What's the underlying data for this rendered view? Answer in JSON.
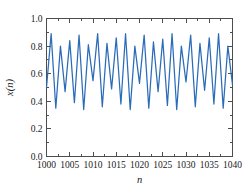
{
  "chart_data": {
    "type": "line",
    "title": "",
    "xlabel": "n",
    "ylabel": "x(n)",
    "xlim": [
      1000,
      1040
    ],
    "ylim": [
      0.0,
      1.0
    ],
    "grid": false,
    "legend": null,
    "line_color": "#2b6cb8",
    "xticks": [
      1000,
      1005,
      1010,
      1015,
      1020,
      1025,
      1030,
      1035,
      1040
    ],
    "xticklabels": [
      "1000",
      "1005",
      "1010",
      "1015",
      "1020",
      "1025",
      "1030",
      "1035",
      "1040"
    ],
    "yticks": [
      0.0,
      0.2,
      0.4,
      0.6,
      0.8,
      1.0
    ],
    "yticklabels": [
      "0.0",
      "0.2",
      "0.4",
      "0.6",
      "0.8",
      "1.0"
    ],
    "xminorticks": [
      1002.5,
      1007.5,
      1012.5,
      1017.5,
      1022.5,
      1027.5,
      1032.5,
      1037.5
    ],
    "yminorticks": [
      0.1,
      0.3,
      0.5,
      0.7,
      0.9
    ],
    "x": [
      1000,
      1001,
      1002,
      1003,
      1004,
      1005,
      1006,
      1007,
      1008,
      1009,
      1010,
      1011,
      1012,
      1013,
      1014,
      1015,
      1016,
      1017,
      1018,
      1019,
      1020,
      1021,
      1022,
      1023,
      1024,
      1025,
      1026,
      1027,
      1028,
      1029,
      1030,
      1031,
      1032,
      1033,
      1034,
      1035,
      1036,
      1037,
      1038,
      1039,
      1040
    ],
    "values": [
      0.5,
      0.89,
      0.35,
      0.8,
      0.47,
      0.84,
      0.39,
      0.88,
      0.34,
      0.81,
      0.55,
      0.89,
      0.36,
      0.82,
      0.49,
      0.86,
      0.38,
      0.89,
      0.34,
      0.8,
      0.53,
      0.88,
      0.35,
      0.83,
      0.47,
      0.85,
      0.37,
      0.89,
      0.34,
      0.8,
      0.54,
      0.88,
      0.36,
      0.82,
      0.48,
      0.86,
      0.38,
      0.89,
      0.35,
      0.8,
      0.52
    ],
    "series": [
      {
        "name": "x(n)",
        "values": [
          0.5,
          0.89,
          0.35,
          0.8,
          0.47,
          0.84,
          0.39,
          0.88,
          0.34,
          0.81,
          0.55,
          0.89,
          0.36,
          0.82,
          0.49,
          0.86,
          0.38,
          0.89,
          0.34,
          0.8,
          0.53,
          0.88,
          0.35,
          0.83,
          0.47,
          0.85,
          0.37,
          0.89,
          0.34,
          0.8,
          0.54,
          0.88,
          0.36,
          0.82,
          0.48,
          0.86,
          0.38,
          0.89,
          0.35,
          0.8,
          0.52
        ]
      }
    ]
  },
  "axes": {
    "x_title": "n",
    "y_title": "x(n)"
  },
  "colors": {
    "line": "#2b6cb8",
    "frame": "#4d4d4d",
    "background": "#ffffff",
    "text": "#1a1a1a"
  }
}
